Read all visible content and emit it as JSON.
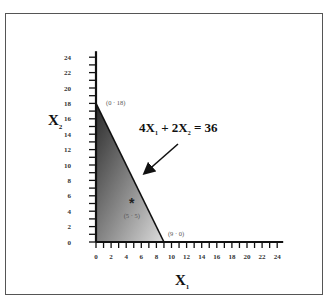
{
  "chart_data": {
    "type": "area",
    "title": "",
    "xlabel": "X",
    "xlabel_sub": "1",
    "ylabel": "X",
    "ylabel_sub": "2",
    "xlim": [
      0,
      24
    ],
    "ylim": [
      0,
      24
    ],
    "x_ticks": [
      0,
      2,
      4,
      6,
      8,
      10,
      12,
      14,
      16,
      18,
      20,
      22,
      24
    ],
    "y_ticks": [
      0,
      2,
      4,
      6,
      8,
      10,
      12,
      14,
      16,
      18,
      20,
      22,
      24
    ],
    "grid": false,
    "constraint": {
      "equation": "4X1 + 2X2 = 36",
      "parts": {
        "c1": "4X",
        "s1": "1",
        "plus": " + 2X",
        "s2": "2",
        "rhs": " = 36"
      },
      "line": [
        [
          0,
          18
        ],
        [
          9,
          0
        ]
      ]
    },
    "feasible_region": {
      "vertices": [
        [
          0,
          0
        ],
        [
          0,
          18
        ],
        [
          9,
          0
        ]
      ],
      "fill": "gradient dark-to-light gray"
    },
    "points": [
      {
        "label": "(0 · 18)",
        "x": 0,
        "y": 18
      },
      {
        "label": "(9 · 0)",
        "x": 9,
        "y": 0
      },
      {
        "label": "(5 · 5)",
        "x": 5,
        "y": 5,
        "marker": "*"
      }
    ],
    "annotation_arrow": {
      "from": "equation label",
      "to": "constraint line"
    }
  }
}
